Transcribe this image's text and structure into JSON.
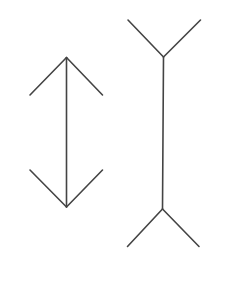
{
  "diagram": {
    "type": "muller-lyer-illusion",
    "background": "#ffffff",
    "stroke_color": "#444444",
    "stroke_width": 1.6,
    "figures": [
      {
        "name": "outward-arrow-figure",
        "shaft": {
          "x1": 66.5,
          "y1": 57.5,
          "x2": 66.5,
          "y2": 207
        },
        "fins": [
          {
            "x1": 66.5,
            "y1": 57.5,
            "x2": 30,
            "y2": 95
          },
          {
            "x1": 66.5,
            "y1": 57.5,
            "x2": 102.5,
            "y2": 95
          },
          {
            "x1": 66.5,
            "y1": 207,
            "x2": 30,
            "y2": 170
          },
          {
            "x1": 66.5,
            "y1": 207,
            "x2": 102.5,
            "y2": 170
          }
        ]
      },
      {
        "name": "inward-fin-figure",
        "shaft": {
          "x1": 163.5,
          "y1": 57,
          "x2": 162.5,
          "y2": 209
        },
        "fins": [
          {
            "x1": 163.5,
            "y1": 57,
            "x2": 128,
            "y2": 20
          },
          {
            "x1": 163.5,
            "y1": 57,
            "x2": 200.5,
            "y2": 20
          },
          {
            "x1": 162.5,
            "y1": 209,
            "x2": 127.5,
            "y2": 246.5
          },
          {
            "x1": 162.5,
            "y1": 209,
            "x2": 199,
            "y2": 246.5
          }
        ]
      }
    ]
  }
}
